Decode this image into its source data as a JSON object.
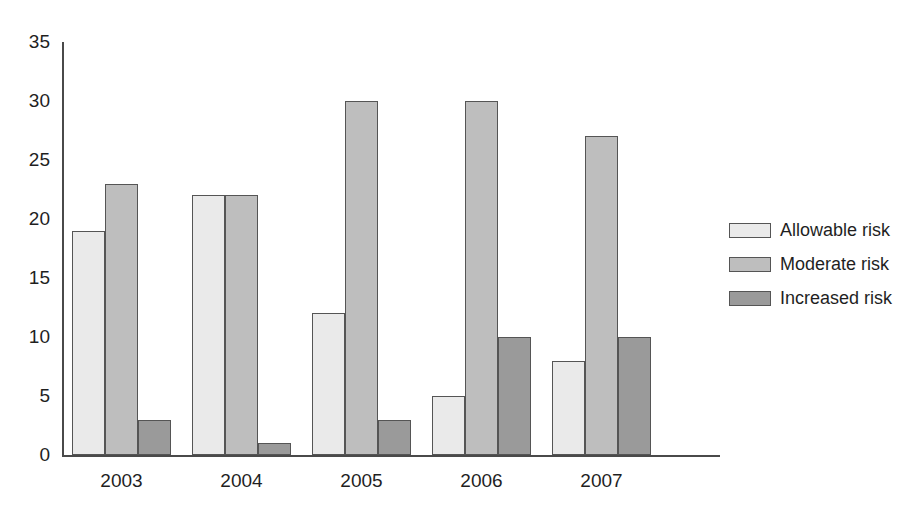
{
  "chart_data": {
    "type": "bar",
    "title": "",
    "subtitle": "",
    "xlabel": "",
    "ylabel": "",
    "categories": [
      "2003",
      "2004",
      "2005",
      "2006",
      "2007"
    ],
    "series": [
      {
        "name": "Allowable risk",
        "color": "#eaeaea",
        "values": [
          19,
          22,
          12,
          5,
          8
        ]
      },
      {
        "name": "Moderate risk",
        "color": "#bebebe",
        "values": [
          23,
          22,
          30,
          30,
          27
        ]
      },
      {
        "name": "Increased risk",
        "color": "#9a9a9a",
        "values": [
          3,
          1,
          3,
          10,
          10
        ]
      }
    ],
    "ylim": [
      0,
      35
    ],
    "yticks": [
      0,
      5,
      10,
      15,
      20,
      25,
      30,
      35
    ],
    "ytick_labels": [
      "0",
      "5",
      "10",
      "15",
      "20",
      "25",
      "30",
      "35"
    ],
    "grid": false,
    "legend_position": "right",
    "bar_border_color": "#555555",
    "axis_color": "#4a4a4a",
    "background": "#ffffff"
  }
}
